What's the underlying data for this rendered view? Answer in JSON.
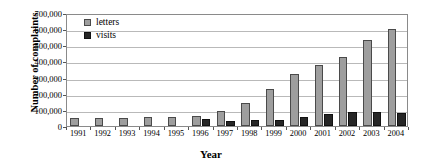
{
  "chart_data": {
    "type": "bar",
    "title": "",
    "xlabel": "Year",
    "ylabel": "Number of complaints",
    "categories": [
      "1991",
      "1992",
      "1993",
      "1994",
      "1995",
      "1996",
      "1997",
      "1998",
      "1999",
      "2000",
      "2001",
      "2002",
      "2003",
      "2004"
    ],
    "series": [
      {
        "name": "letters",
        "color": "#9e9e9e",
        "values": [
          50000,
          50000,
          50000,
          58000,
          58000,
          65000,
          95000,
          145000,
          230000,
          325000,
          375000,
          430000,
          530000,
          600000
        ]
      },
      {
        "name": "visits",
        "color": "#262626",
        "values": [
          0,
          0,
          0,
          0,
          0,
          42000,
          30000,
          40000,
          35000,
          58000,
          75000,
          85000,
          85000,
          82000
        ]
      }
    ],
    "ylim": [
      0,
      700000
    ],
    "yticks": [
      "0",
      "100,000",
      "200,000",
      "300,000",
      "400,000",
      "500,000",
      "600,000",
      "700,000"
    ],
    "ytick_values": [
      0,
      100000,
      200000,
      300000,
      400000,
      500000,
      600000,
      700000
    ],
    "grid": true,
    "legend_position": "top-left"
  },
  "legend": {
    "letters_label": "letters",
    "visits_label": "visits"
  },
  "axes": {
    "y_title": "Number of complaints",
    "x_title": "Year"
  }
}
